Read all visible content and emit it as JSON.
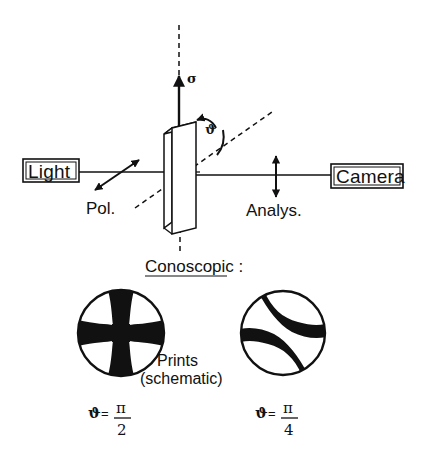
{
  "figure": {
    "background_color": "#ffffff",
    "ink_color": "#111111"
  },
  "setup": {
    "source_box_label": "Light",
    "detector_box_label": "Camera",
    "polarizer_label": "Pol.",
    "analyzer_label": "Analys.",
    "stress_axis_symbol": "σ",
    "angle_symbol": "ϑ"
  },
  "conoscopic": {
    "heading": "Conoscopic :",
    "caption_line1": "Prints",
    "caption_line2": "(schematic)",
    "prints": [
      {
        "name": "maltese-cross",
        "angle_symbol": "ϑ",
        "equals": "=",
        "numerator": "π",
        "denominator": "2"
      },
      {
        "name": "split-isogyre",
        "angle_symbol": "ϑ",
        "equals": "=",
        "numerator": "π",
        "denominator": "4"
      }
    ]
  }
}
